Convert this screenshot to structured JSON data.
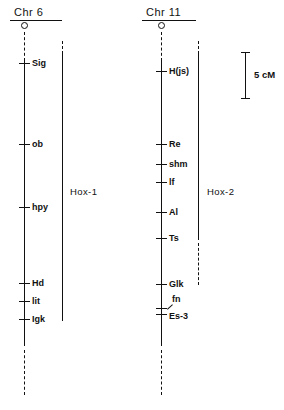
{
  "figure": {
    "type": "genetic-linkage-map",
    "background": "#ffffff",
    "ink_color": "#111111"
  },
  "scale_bar": {
    "label": "5 cM",
    "value": 5,
    "unit": "cM",
    "pixel_length": 46,
    "x": 245,
    "y_top": 52,
    "y_bottom": 98
  },
  "chromosomes": [
    {
      "id": "chr6",
      "title": "Chr 6",
      "title_x": 14,
      "title_y": 6,
      "underline_x": 10,
      "underline_y": 20,
      "underline_w": 52,
      "centromere_x": 21,
      "centromere_y": 22,
      "axis_x": 24,
      "dash_top_y": 32,
      "dash_top_h": 29,
      "solid_y": 61,
      "solid_h": 285,
      "dash_bottom_y": 350,
      "dash_bottom_h": 45,
      "loci": [
        {
          "name": "Sig",
          "y": 63,
          "tick_x": 19,
          "tick_w": 11,
          "label_x": 32
        },
        {
          "name": "ob",
          "y": 144,
          "tick_x": 19,
          "tick_w": 11,
          "label_x": 32
        },
        {
          "name": "hpy",
          "y": 207,
          "tick_x": 19,
          "tick_w": 11,
          "label_x": 32
        },
        {
          "name": "Hd",
          "y": 283,
          "tick_x": 19,
          "tick_w": 11,
          "label_x": 32
        },
        {
          "name": "lit",
          "y": 301,
          "tick_x": 19,
          "tick_w": 11,
          "label_x": 32
        },
        {
          "name": "Igk",
          "y": 319,
          "tick_x": 19,
          "tick_w": 11,
          "label_x": 32
        }
      ],
      "cluster": {
        "name": "Hox-1",
        "bar_x": 62,
        "dash_top_y": 41,
        "dash_top_h": 13,
        "solid_y": 54,
        "solid_h": 267,
        "label_x": 70,
        "label_y": 186
      }
    },
    {
      "id": "chr11",
      "title": "Chr 11",
      "title_x": 146,
      "title_y": 6,
      "underline_x": 142,
      "underline_y": 20,
      "underline_w": 54,
      "centromere_x": 158,
      "centromere_y": 22,
      "axis_x": 161,
      "dash_top_y": 32,
      "dash_top_h": 29,
      "solid_y": 61,
      "solid_h": 285,
      "dash_bottom_y": 350,
      "dash_bottom_h": 45,
      "loci": [
        {
          "name": "H(js)",
          "y": 71,
          "tick_x": 156,
          "tick_w": 11,
          "label_x": 169
        },
        {
          "name": "Re",
          "y": 144,
          "tick_x": 156,
          "tick_w": 11,
          "label_x": 169
        },
        {
          "name": "shm",
          "y": 164,
          "tick_x": 156,
          "tick_w": 11,
          "label_x": 169
        },
        {
          "name": "lf",
          "y": 182,
          "tick_x": 156,
          "tick_w": 11,
          "label_x": 169
        },
        {
          "name": "Al",
          "y": 212,
          "tick_x": 156,
          "tick_w": 11,
          "label_x": 169
        },
        {
          "name": "Ts",
          "y": 238,
          "tick_x": 156,
          "tick_w": 11,
          "label_x": 169
        },
        {
          "name": "Glk",
          "y": 284,
          "tick_x": 156,
          "tick_w": 11,
          "label_x": 169
        },
        {
          "name": "fn",
          "y": 308,
          "tick_x": 156,
          "tick_w": 11,
          "label_x": 172,
          "label_offset_y": -9,
          "pointer": true
        },
        {
          "name": "Es-3",
          "y": 314,
          "tick_x": 156,
          "tick_w": 11,
          "label_x": 169,
          "label_offset_y": 2
        }
      ],
      "cluster": {
        "name": "Hox-2",
        "bar_x": 198,
        "dash_top_y": 41,
        "dash_top_h": 13,
        "solid_y": 54,
        "solid_h": 186,
        "dash_mid_y": 243,
        "dash_mid_h": 42,
        "label_x": 207,
        "label_y": 186
      }
    }
  ]
}
